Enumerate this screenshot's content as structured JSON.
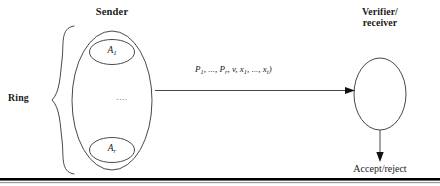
{
  "diagram": {
    "kind": "ring-signature-protocol-diagram",
    "background_color": "#ffffff",
    "stroke_color": "#333333",
    "text_color": "#1a1a1a",
    "sender": {
      "title": "Sender",
      "group_label": "Ring",
      "members": [
        {
          "base": "A",
          "subscript": "1",
          "text": "A₁"
        },
        {
          "base": "A",
          "subscript": "r",
          "text": "Aᵣ"
        }
      ],
      "ellipsis": "...."
    },
    "message": {
      "open_paren": "(",
      "text": "(P₁, ..., Pᵣ, v, x₁, ..., xₜ)",
      "parts": {
        "p_first": "P",
        "p_first_sub": "1",
        "sep1": ", ...,",
        "p_last": "P",
        "p_last_sub": "r",
        "v": "v",
        "x_first": "x",
        "x_first_sub": "1",
        "sep2": ", ...,",
        "x_last": "x",
        "x_last_sub": "t",
        "close_paren": ")"
      }
    },
    "verifier": {
      "title_line1": "Verifier/",
      "title_line2": "receiver"
    },
    "outcome": {
      "label": "Accept/reject"
    },
    "arrows": [
      {
        "name": "sender-to-verifier",
        "direction": "right"
      },
      {
        "name": "verifier-to-outcome",
        "direction": "down"
      }
    ],
    "rule": {
      "name": "bottom-rule",
      "color": "#000000"
    }
  }
}
